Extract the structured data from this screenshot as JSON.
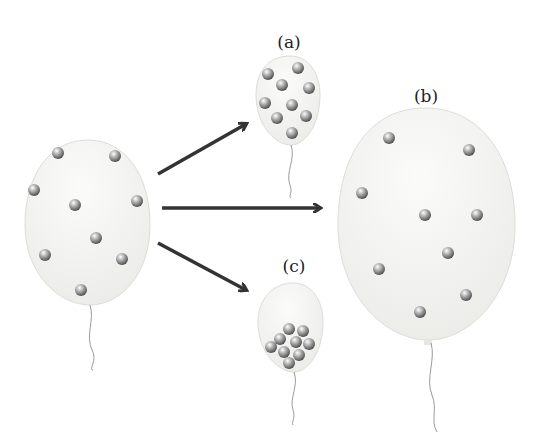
{
  "diagram": {
    "type": "balloon gas particle comparison",
    "colors": {
      "balloon_fill": "#f1f1ef",
      "balloon_edge": "#dcdcd8",
      "arrow": "#333333",
      "particle": "#8a8a8a",
      "string": "#9a9a9a"
    },
    "source": {
      "name": "original balloon",
      "particle_count": 9
    },
    "outcomes": [
      {
        "label": "(a)",
        "description": "smaller balloon, particles close together",
        "particle_count": 9
      },
      {
        "label": "(b)",
        "description": "larger balloon, particles spread out",
        "particle_count": 9
      },
      {
        "label": "(c)",
        "description": "smaller balloon, particles clumped at bottom",
        "particle_count": 9
      }
    ]
  }
}
